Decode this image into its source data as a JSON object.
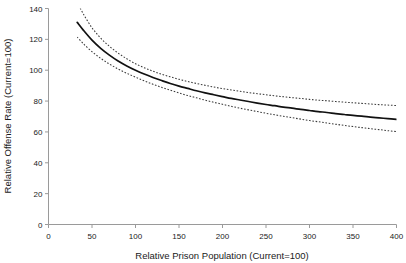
{
  "chart_data": {
    "type": "line",
    "title": "",
    "xlabel": "Relative Prison Population (Current=100)",
    "ylabel": "Relative Offense Rate (Current=100)",
    "xlim": [
      0,
      400
    ],
    "ylim": [
      0,
      140
    ],
    "xticks": [
      0,
      50,
      100,
      150,
      200,
      250,
      300,
      350,
      400
    ],
    "yticks": [
      0,
      20,
      40,
      60,
      80,
      100,
      120,
      140
    ],
    "grid": false,
    "legend": "none",
    "x": [
      33,
      40,
      50,
      60,
      70,
      80,
      90,
      100,
      110,
      120,
      130,
      140,
      150,
      160,
      170,
      180,
      190,
      200,
      210,
      220,
      230,
      240,
      250,
      260,
      270,
      280,
      290,
      300,
      310,
      320,
      330,
      340,
      350,
      360,
      370,
      380,
      390,
      400
    ],
    "series": [
      {
        "name": "Estimated relative offense rate",
        "style": "solid",
        "values": [
          131.0,
          126.0,
          119.5,
          114.2,
          109.8,
          106.0,
          102.8,
          100.0,
          97.5,
          95.3,
          93.3,
          91.4,
          89.7,
          88.2,
          86.7,
          85.3,
          84.1,
          82.9,
          81.7,
          80.7,
          79.7,
          78.7,
          77.8,
          77.0,
          76.1,
          75.4,
          74.6,
          73.9,
          73.2,
          72.6,
          71.9,
          71.3,
          70.7,
          70.2,
          69.6,
          69.1,
          68.6,
          68.1
        ]
      },
      {
        "name": "Upper confidence band",
        "style": "dotted",
        "values": [
          144.0,
          136.5,
          127.5,
          120.8,
          115.5,
          111.1,
          107.4,
          104.2,
          101.6,
          99.4,
          97.4,
          95.7,
          94.1,
          92.7,
          91.4,
          90.2,
          89.1,
          88.1,
          87.2,
          86.3,
          85.5,
          84.8,
          84.1,
          83.4,
          82.8,
          82.2,
          81.7,
          81.1,
          80.6,
          80.2,
          79.7,
          79.3,
          78.9,
          78.5,
          78.1,
          77.7,
          77.4,
          77.1
        ]
      },
      {
        "name": "Lower confidence band",
        "style": "dotted",
        "values": [
          121.5,
          117.2,
          112.0,
          107.7,
          104.0,
          100.8,
          98.0,
          95.5,
          93.1,
          90.9,
          88.9,
          87.0,
          85.3,
          83.6,
          82.1,
          80.6,
          79.2,
          77.9,
          76.6,
          75.4,
          74.3,
          73.2,
          72.1,
          71.1,
          70.1,
          69.2,
          68.3,
          67.4,
          66.6,
          65.8,
          65.0,
          64.2,
          63.5,
          62.8,
          62.1,
          61.5,
          60.8,
          60.2
        ]
      }
    ]
  },
  "figure": {
    "background_color": "#ffffff",
    "axis_color": "#9a9a9a",
    "main_series_color": "#111111",
    "band_series_color": "#3a3a3a"
  }
}
